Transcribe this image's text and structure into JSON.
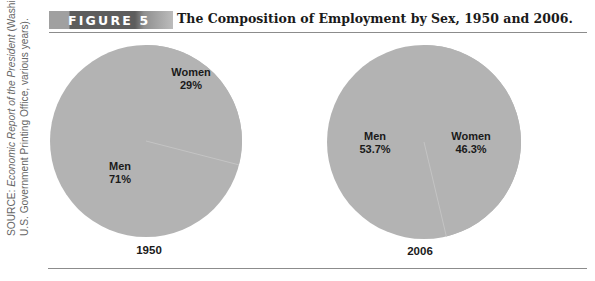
{
  "figure": {
    "badge": "FIGURE 5",
    "title": "The Composition of Employment by Sex, 1950 and 2006."
  },
  "source": {
    "prefix": "SOURCE: ",
    "italic": "Economic Report of the President",
    "suffix_line1": " (Washington, DC:",
    "line2": "U.S. Government Printing Office, various years)."
  },
  "colors": {
    "pie_fill": "#b3b3b3",
    "seam": "#c4c4c4",
    "badge_dark": "#5d5d5d",
    "rule": "#8c8c8c"
  },
  "chart_data": [
    {
      "type": "pie",
      "title": "1950",
      "labels": [
        "Women",
        "Men"
      ],
      "values": [
        29,
        71
      ],
      "value_labels": [
        "29%",
        "71%"
      ]
    },
    {
      "type": "pie",
      "title": "2006",
      "labels": [
        "Women",
        "Men"
      ],
      "values": [
        46.3,
        53.7
      ],
      "value_labels": [
        "46.3%",
        "53.7%"
      ]
    }
  ]
}
